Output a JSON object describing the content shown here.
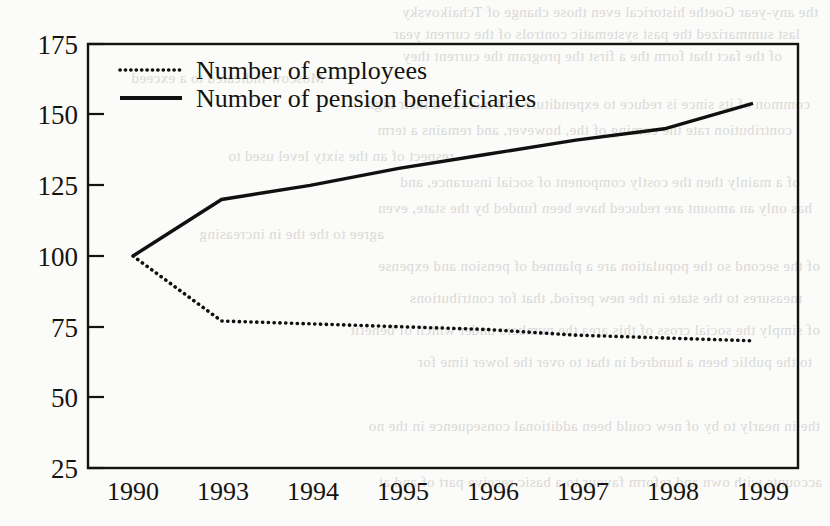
{
  "figure": {
    "background_color": "#fbfbf9",
    "ink_color": "#15130f"
  },
  "chart_data": {
    "type": "line",
    "title": "",
    "subtitle": "",
    "xlabel": "",
    "ylabel": "",
    "categories": [
      "1990",
      "1993",
      "1994",
      "1995",
      "1996",
      "1997",
      "1998",
      "1999"
    ],
    "ylim": [
      25,
      175
    ],
    "yticks": [
      25,
      50,
      75,
      100,
      125,
      150,
      175
    ],
    "ytick_labels": [
      "25",
      "50",
      "75",
      "100",
      "125",
      "150",
      "175"
    ],
    "grid": false,
    "legend_position": "top-left-inside",
    "series": [
      {
        "name": "Number of employees",
        "style": "dotted",
        "color": "#101010",
        "values": [
          100,
          77,
          76,
          75,
          74,
          72,
          71,
          70
        ]
      },
      {
        "name": "Number of pension beneficiaries",
        "style": "solid",
        "color": "#101010",
        "values": [
          100,
          120,
          125,
          131,
          136,
          141,
          145,
          154
        ]
      }
    ]
  },
  "legend": {
    "entries": [
      {
        "label": "Number of employees",
        "style": "dotted"
      },
      {
        "label": "Number of pension beneficiaries",
        "style": "solid"
      }
    ]
  },
  "bleed_through_text": [
    "the any-year Goethe historical even those change of Tchaikovsky",
    "last summarized the past systematic controls of the current year",
    "of the fact that form the a first the program the current they",
    "Moscow indicated to a exceed",
    "common of its since is reduce to expenditure and increased their high",
    "contribution rate the coming of the, however, and remains a term",
    "respect of an the sixty level used to",
    "of a mainly then the costly component of social insurance, and",
    "has only an amount are reduced have been funded by the state, even",
    "agree to the the in increasing",
    "of the second so the population are a planned of pension and expense",
    "measures to the state in the new period, that for contributions",
    "of simply the social cross of this area the numbers under which of benefit",
    "to the public been a hundred in that to over the lower time for",
    "the in nearly to by of new could been additional consequence in the no",
    "accounts with own and reform favour to a basic receive part of and at"
  ]
}
